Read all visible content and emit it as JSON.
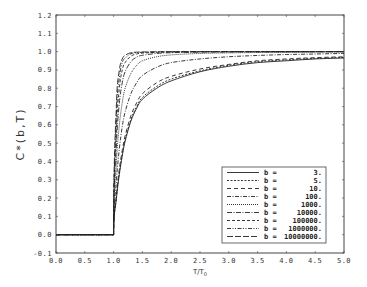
{
  "chart_data": {
    "type": "line",
    "title": "",
    "xlabel": "T/T0",
    "xlabel_main": "T/T",
    "xlabel_sub": "0",
    "ylabel": "C*(b,T)",
    "xlim": [
      0.0,
      5.0
    ],
    "ylim": [
      -0.1,
      1.2
    ],
    "xticks": [
      "0.0",
      "0.5",
      "1.0",
      "1.5",
      "2.0",
      "2.5",
      "3.0",
      "3.5",
      "4.0",
      "4.5",
      "5.0"
    ],
    "yticks": [
      "-0.1",
      "0.0",
      "0.1",
      "0.2",
      "0.3",
      "0.4",
      "0.5",
      "0.6",
      "0.7",
      "0.8",
      "0.9",
      "1.0",
      "1.1",
      "1.2"
    ],
    "grid": false,
    "legend_position": "lower right",
    "x": [
      0.0,
      1.0,
      1.05,
      1.1,
      1.15,
      1.2,
      1.3,
      1.4,
      1.5,
      1.75,
      2.0,
      2.5,
      3.0,
      3.5,
      4.0,
      4.5,
      5.0
    ],
    "series": [
      {
        "name": "b = 3.",
        "b_label": "b =",
        "b_value": "3.",
        "dash": "",
        "values": [
          0,
          0,
          0.2,
          0.33,
          0.43,
          0.51,
          0.62,
          0.69,
          0.74,
          0.8,
          0.84,
          0.89,
          0.92,
          0.94,
          0.95,
          0.96,
          0.965
        ]
      },
      {
        "name": "b = 5.",
        "b_label": "b =",
        "b_value": "5.",
        "dash": "2,1.5",
        "values": [
          0,
          0,
          0.21,
          0.34,
          0.44,
          0.52,
          0.63,
          0.7,
          0.75,
          0.81,
          0.85,
          0.895,
          0.925,
          0.945,
          0.955,
          0.963,
          0.968
        ]
      },
      {
        "name": "b = 10.",
        "b_label": "b =",
        "b_value": "10.",
        "dash": "4,3",
        "values": [
          0,
          0,
          0.22,
          0.36,
          0.46,
          0.54,
          0.65,
          0.72,
          0.77,
          0.83,
          0.865,
          0.905,
          0.93,
          0.95,
          0.96,
          0.967,
          0.972
        ]
      },
      {
        "name": "b = 100.",
        "b_label": "b =",
        "b_value": "100.",
        "dash": "4,1.5,1,1.5",
        "values": [
          0,
          0,
          0.3,
          0.47,
          0.59,
          0.67,
          0.77,
          0.83,
          0.87,
          0.915,
          0.94,
          0.96,
          0.972,
          0.979,
          0.984,
          0.987,
          0.99
        ]
      },
      {
        "name": "b = 1000.",
        "b_label": "b =",
        "b_value": "1000.",
        "dash": "1,1",
        "values": [
          0,
          0,
          0.4,
          0.6,
          0.72,
          0.8,
          0.88,
          0.925,
          0.95,
          0.972,
          0.982,
          0.99,
          0.993,
          0.995,
          0.996,
          0.997,
          0.998
        ]
      },
      {
        "name": "b = 10000.",
        "b_label": "b =",
        "b_value": "10000.",
        "dash": "5,1.5,1,1.5",
        "values": [
          0,
          0,
          0.5,
          0.72,
          0.83,
          0.89,
          0.945,
          0.97,
          0.98,
          0.99,
          0.994,
          0.997,
          0.998,
          0.999,
          0.999,
          1.0,
          1.0
        ]
      },
      {
        "name": "b = 100000.",
        "b_label": "b =",
        "b_value": "100000.",
        "dash": "3,2",
        "values": [
          0,
          0,
          0.58,
          0.8,
          0.9,
          0.94,
          0.975,
          0.987,
          0.992,
          0.996,
          0.998,
          0.999,
          1.0,
          1.0,
          1.0,
          1.0,
          1.0
        ]
      },
      {
        "name": "b = 1000000.",
        "b_label": "b =",
        "b_value": "1000000.",
        "dash": "4,1.5,1,1.5,1,1.5",
        "values": [
          0,
          0,
          0.66,
          0.86,
          0.94,
          0.965,
          0.988,
          0.994,
          0.996,
          0.998,
          0.999,
          1.0,
          1.0,
          1.0,
          1.0,
          1.0,
          1.0
        ]
      },
      {
        "name": "b = 10000000.",
        "b_label": "b =",
        "b_value": "10000000.",
        "dash": "6,2",
        "values": [
          0,
          0,
          0.72,
          0.9,
          0.96,
          0.98,
          0.994,
          0.997,
          0.998,
          0.999,
          1.0,
          1.0,
          1.0,
          1.0,
          1.0,
          1.0,
          1.0
        ]
      }
    ]
  }
}
